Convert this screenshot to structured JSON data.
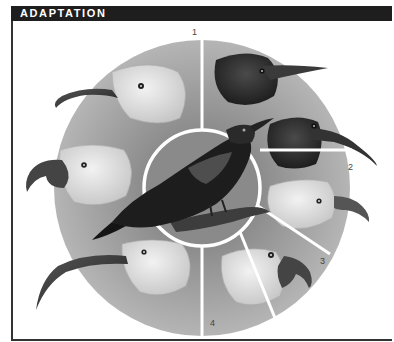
{
  "header": {
    "title": "ADAPTATION"
  },
  "figure": {
    "center_label": "ancestral-bird",
    "segment_labels": [
      "1",
      "2",
      "3",
      "4"
    ],
    "heads": [
      {
        "position": "upper-left",
        "beak": "long thin curved (nectar feeder)",
        "tone": "light"
      },
      {
        "position": "upper-right",
        "beak": "short straight pointed",
        "tone": "dark"
      },
      {
        "position": "right",
        "beak": "curved pointed",
        "tone": "dark"
      },
      {
        "position": "right-lower",
        "beak": "short hooked finch-like",
        "tone": "light"
      },
      {
        "position": "lower-right",
        "beak": "heavy parrot-like",
        "tone": "light"
      },
      {
        "position": "lower-left",
        "beak": "very long sickle-shaped",
        "tone": "light"
      },
      {
        "position": "left",
        "beak": "hooked with large lower mandible",
        "tone": "light"
      }
    ],
    "colors": {
      "header_bg": "#1e1e1e",
      "header_text": "#ffffff",
      "wheel_gray": "#9a9a9a",
      "wheel_inner": "#7d7d7d",
      "divider": "#ffffff"
    }
  }
}
